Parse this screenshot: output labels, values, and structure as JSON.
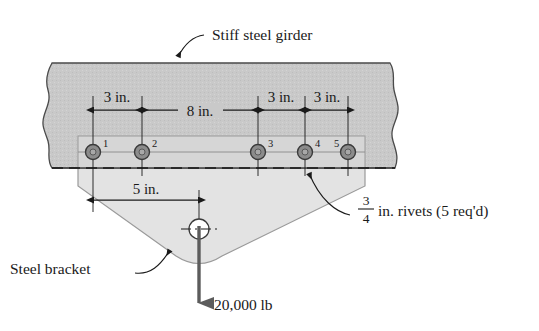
{
  "figure": {
    "title_label": "Stiff steel girder",
    "bracket_label": "Steel bracket",
    "load_label": "20,000 lb",
    "rivet_note": {
      "numerator": "3",
      "denominator": "4",
      "text": "in. rivets (5 req'd)"
    },
    "dimensions": [
      {
        "id": "d1",
        "label": "3 in.",
        "value": 3,
        "unit": "in.",
        "from_rivet": 1,
        "to_rivet": 2
      },
      {
        "id": "d2",
        "label": "8 in.",
        "value": 8,
        "unit": "in.",
        "from_rivet": 2,
        "to_rivet": 3
      },
      {
        "id": "d3",
        "label": "3 in.",
        "value": 3,
        "unit": "in.",
        "from_rivet": 3,
        "to_rivet": 4
      },
      {
        "id": "d4",
        "label": "3 in.",
        "value": 3,
        "unit": "in.",
        "from_rivet": 4,
        "to_rivet": 5
      },
      {
        "id": "d5",
        "label": "5 in.",
        "value": 5,
        "unit": "in.",
        "from_rivet": 1,
        "to_rivet": "load-point"
      }
    ],
    "rivets": [
      {
        "number": "1"
      },
      {
        "number": "2"
      },
      {
        "number": "3"
      },
      {
        "number": "4"
      },
      {
        "number": "5"
      }
    ],
    "colors": {
      "girder_fill": "#c9c9c9",
      "girder_stroke": "#4a4a4a",
      "bracket_fill": "#e3e3e3",
      "bracket_stroke": "#8a8a8a",
      "plate_fill": "#d6d6d6",
      "rivet_fill": "#8c8c8c",
      "line": "#1a1a1a",
      "load_arrow": "#5c5c5c"
    }
  }
}
